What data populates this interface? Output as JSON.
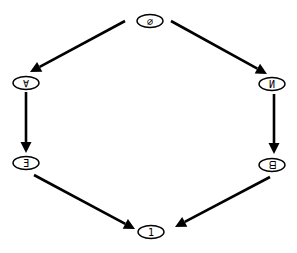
{
  "diagram": {
    "type": "directed-graph",
    "nodes": [
      {
        "id": "top",
        "label": "∅"
      },
      {
        "id": "upper-left",
        "label": "∀"
      },
      {
        "id": "upper-right",
        "label": "И"
      },
      {
        "id": "lower-left",
        "label": "Ǝ"
      },
      {
        "id": "lower-right",
        "label": "ᗺ"
      },
      {
        "id": "bottom",
        "label": "1"
      }
    ],
    "edges": [
      {
        "from": "top",
        "to": "upper-left"
      },
      {
        "from": "top",
        "to": "upper-right"
      },
      {
        "from": "upper-left",
        "to": "lower-left"
      },
      {
        "from": "upper-right",
        "to": "lower-right"
      },
      {
        "from": "lower-left",
        "to": "bottom"
      },
      {
        "from": "lower-right",
        "to": "bottom"
      }
    ]
  }
}
